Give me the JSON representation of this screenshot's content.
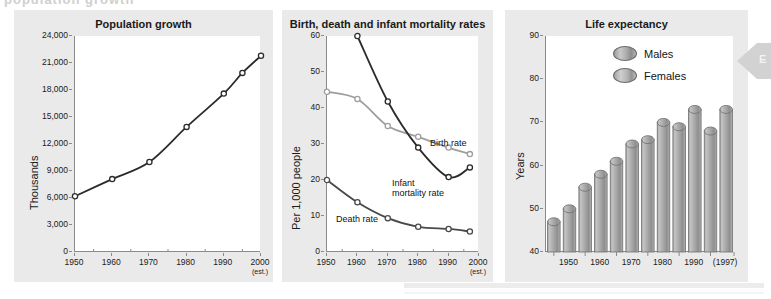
{
  "top_partial_text": "population growth",
  "edge_tab": {
    "letter": "E",
    "icon": "left-triangle-icon"
  },
  "colors": {
    "panel_bg": "#eaeaea",
    "plot_bg": "#ffffff",
    "axis": "#8a8a8a",
    "dark_series": "#2b2b2b",
    "mid_series": "#555555",
    "light_series": "#9e9e9e",
    "bar_fill": "#a9a9a9",
    "bar_edge": "#6a6a6a"
  },
  "charts": {
    "population": {
      "title": "Population growth",
      "ylabel": "Thousands",
      "yticks": [
        "0",
        "3,000",
        "6,000",
        "9,000",
        "12,000",
        "15,000",
        "18,000",
        "21,000",
        "24,000"
      ],
      "xticks": [
        "1950",
        "1960",
        "1970",
        "1980",
        "1990",
        "2000"
      ],
      "xnote": "(est.)"
    },
    "rates": {
      "title": "Birth, death and infant mortality rates",
      "ylabel": "Per 1,000 people",
      "yticks": [
        "0",
        "10",
        "20",
        "30",
        "40",
        "50",
        "60"
      ],
      "xticks": [
        "1950",
        "1960",
        "1970",
        "1980",
        "1990",
        "2000"
      ],
      "xnote": "(est.)",
      "label_birth": "Birth rate",
      "label_infant_line1": "Infant",
      "label_infant_line2": "mortality rate",
      "label_death": "Death rate"
    },
    "life": {
      "title": "Life expectancy",
      "ylabel": "Years",
      "yticks": [
        "40",
        "50",
        "60",
        "70",
        "80",
        "90"
      ],
      "xticks": [
        "1950",
        "1960",
        "1970",
        "1980",
        "1990",
        "(1997)"
      ],
      "legend": [
        {
          "name": "Males",
          "swatch": "sw-male"
        },
        {
          "name": "Females",
          "swatch": "sw-female"
        }
      ]
    }
  },
  "chart_data": [
    {
      "type": "line",
      "title": "Population growth",
      "xlabel": "",
      "ylabel": "Thousands",
      "xlim": [
        1950,
        2000
      ],
      "ylim": [
        0,
        24000
      ],
      "yticks": [
        0,
        3000,
        6000,
        9000,
        12000,
        15000,
        18000,
        21000,
        24000
      ],
      "xticks": [
        1950,
        1960,
        1970,
        1980,
        1990,
        2000
      ],
      "grid": false,
      "legend": "none",
      "annotations": [
        "(est.) under 2000"
      ],
      "series": [
        {
          "name": "Population",
          "marker": "open-circle",
          "color": "#2b2b2b",
          "x": [
            1950,
            1960,
            1970,
            1980,
            1990,
            1995,
            2000
          ],
          "values": [
            6200,
            8100,
            10000,
            13900,
            17600,
            19900,
            21800
          ]
        }
      ]
    },
    {
      "type": "line",
      "title": "Birth, death and infant mortality rates",
      "xlabel": "",
      "ylabel": "Per 1,000 people",
      "xlim": [
        1950,
        2000
      ],
      "ylim": [
        0,
        60
      ],
      "yticks": [
        0,
        10,
        20,
        30,
        40,
        50,
        60
      ],
      "xticks": [
        1950,
        1960,
        1970,
        1980,
        1990,
        2000
      ],
      "grid": false,
      "legend": "inline-labels",
      "annotations": [
        "(est.) under 2000"
      ],
      "series": [
        {
          "name": "Birth rate",
          "marker": "open-circle",
          "color": "#9e9e9e",
          "x": [
            1950,
            1960,
            1970,
            1980,
            1990,
            1997
          ],
          "values": [
            44.5,
            42.5,
            35.0,
            32.0,
            29.0,
            27.2
          ]
        },
        {
          "name": "Infant mortality rate",
          "marker": "open-circle",
          "color": "#2b2b2b",
          "x": [
            1960,
            1970,
            1980,
            1990,
            1997
          ],
          "values": [
            60.0,
            41.8,
            29.0,
            20.8,
            23.5
          ]
        },
        {
          "name": "Death rate",
          "marker": "open-circle",
          "color": "#4a4a4a",
          "x": [
            1950,
            1960,
            1970,
            1980,
            1990,
            1997
          ],
          "values": [
            20.0,
            13.8,
            9.4,
            7.0,
            6.4,
            5.7
          ]
        }
      ]
    },
    {
      "type": "bar",
      "title": "Life expectancy",
      "xlabel": "",
      "ylabel": "Years",
      "ylim": [
        40,
        90
      ],
      "yticks": [
        40,
        50,
        60,
        70,
        80,
        90
      ],
      "xticks": [
        1950,
        1960,
        1970,
        1980,
        1990,
        1997
      ],
      "grid": false,
      "legend": "top-center",
      "categories": [
        "1945 M",
        "1950 F",
        "1955 M",
        "1960 F",
        "1965 M",
        "1970 F",
        "1975 M",
        "1980 F",
        "1985 M",
        "1990 F",
        "1997 M"
      ],
      "bars": [
        {
          "year": "1945",
          "group": "Males",
          "value": 47
        },
        {
          "year": "1950",
          "group": "Females",
          "value": 50
        },
        {
          "year": "1955",
          "group": "Males",
          "value": 55
        },
        {
          "year": "1960",
          "group": "Females",
          "value": 58
        },
        {
          "year": "1965",
          "group": "Males",
          "value": 61
        },
        {
          "year": "1970",
          "group": "Females",
          "value": 65
        },
        {
          "year": "1975",
          "group": "Males",
          "value": 66
        },
        {
          "year": "1980",
          "group": "Females",
          "value": 70
        },
        {
          "year": "1985",
          "group": "Males",
          "value": 69
        },
        {
          "year": "1990",
          "group": "Females",
          "value": 73
        },
        {
          "year": "1997",
          "group": "Males",
          "value": 68
        },
        {
          "year": "1997",
          "group": "Females",
          "value": 73
        }
      ],
      "values": [
        47,
        50,
        55,
        58,
        61,
        65,
        66,
        70,
        69,
        73,
        68,
        73
      ]
    }
  ]
}
